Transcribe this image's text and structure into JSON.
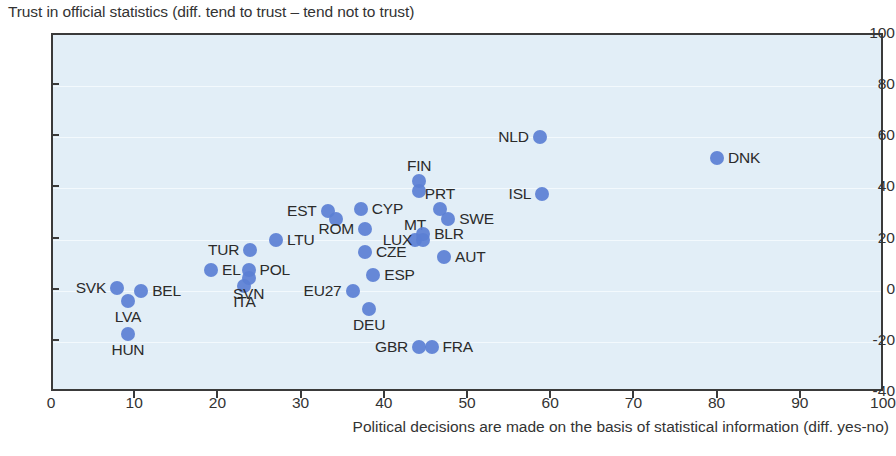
{
  "chart_data": {
    "type": "scatter",
    "title": "Trust in official statistics (diff. tend to trust – tend not to trust)",
    "ylabel": "Trust in official statistics (diff. tend to trust – tend not to trust)",
    "xlabel": "Political decisions are made on the basis of statistical information (diff. yes-no)",
    "xlim": [
      0,
      100
    ],
    "ylim": [
      -40,
      100
    ],
    "xticks": [
      0,
      10,
      20,
      30,
      40,
      50,
      60,
      70,
      80,
      90,
      100
    ],
    "yticks": [
      -40,
      -20,
      0,
      20,
      40,
      60,
      80,
      100
    ],
    "grid": true,
    "legend": "none",
    "marker_color": "#5b7fd4",
    "plot_background": "#e2eef7",
    "points": [
      {
        "label": "SVK",
        "x": 7.7,
        "y": 1,
        "label_pos": "left"
      },
      {
        "label": "LVA",
        "x": 9.0,
        "y": -4,
        "label_pos": "below"
      },
      {
        "label": "BEL",
        "x": 10.6,
        "y": 0,
        "label_pos": "right"
      },
      {
        "label": "HUN",
        "x": 9.0,
        "y": -17,
        "label_pos": "below"
      },
      {
        "label": "EL",
        "x": 19.0,
        "y": 8,
        "label_pos": "right"
      },
      {
        "label": "ITA",
        "x": 23.0,
        "y": 2,
        "label_pos": "below"
      },
      {
        "label": "SVN",
        "x": 23.5,
        "y": 5,
        "label_pos": "below"
      },
      {
        "label": "POL",
        "x": 23.5,
        "y": 8,
        "label_pos": "right"
      },
      {
        "label": "TUR",
        "x": 23.7,
        "y": 16,
        "label_pos": "left"
      },
      {
        "label": "LTU",
        "x": 26.8,
        "y": 20,
        "label_pos": "right"
      },
      {
        "label": "EST",
        "x": 33.0,
        "y": 31,
        "label_pos": "left"
      },
      {
        "label": "EST2",
        "x": 34.0,
        "y": 28,
        "label_pos": "none"
      },
      {
        "label": "CYP",
        "x": 37.0,
        "y": 32,
        "label_pos": "right"
      },
      {
        "label": "ROM",
        "x": 37.5,
        "y": 24,
        "label_pos": "left"
      },
      {
        "label": "CZE",
        "x": 37.5,
        "y": 15,
        "label_pos": "right"
      },
      {
        "label": "ESP",
        "x": 38.5,
        "y": 6,
        "label_pos": "right"
      },
      {
        "label": "EU27",
        "x": 36.0,
        "y": 0,
        "label_pos": "left"
      },
      {
        "label": "DEU",
        "x": 38.0,
        "y": -7,
        "label_pos": "below"
      },
      {
        "label": "MT",
        "x": 43.5,
        "y": 20,
        "label_pos": "above"
      },
      {
        "label": "LUX",
        "x": 44.5,
        "y": 20,
        "label_pos": "left"
      },
      {
        "label": "FIN",
        "x": 44.0,
        "y": 43,
        "label_pos": "above"
      },
      {
        "label": "FIN2",
        "x": 44.0,
        "y": 39,
        "label_pos": "none"
      },
      {
        "label": "BLR",
        "x": 44.5,
        "y": 22,
        "label_pos": "right"
      },
      {
        "label": "PRT",
        "x": 46.5,
        "y": 32,
        "label_pos": "above"
      },
      {
        "label": "SWE",
        "x": 47.5,
        "y": 28,
        "label_pos": "right"
      },
      {
        "label": "AUT",
        "x": 47.0,
        "y": 13,
        "label_pos": "right"
      },
      {
        "label": "GBR",
        "x": 44.0,
        "y": -22,
        "label_pos": "left"
      },
      {
        "label": "FRA",
        "x": 45.5,
        "y": -22,
        "label_pos": "right"
      },
      {
        "label": "NLD",
        "x": 58.5,
        "y": 60,
        "label_pos": "left"
      },
      {
        "label": "ISL",
        "x": 58.8,
        "y": 38,
        "label_pos": "left"
      },
      {
        "label": "DNK",
        "x": 79.8,
        "y": 52,
        "label_pos": "right"
      }
    ]
  }
}
